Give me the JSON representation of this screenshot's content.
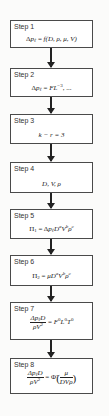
{
  "diagram": {
    "title": "",
    "steps": [
      {
        "label": "Step 1",
        "formula": "Δp_ℓ = f(D, ρ, μ, V)"
      },
      {
        "label": "Step 2",
        "formula": "Δp_ℓ = FL^−3, ..."
      },
      {
        "label": "Step 3",
        "formula": "k − r = 3"
      },
      {
        "label": "Step 4",
        "formula": "D, V, ρ"
      },
      {
        "label": "Step 5",
        "formula": "Π_1 = Δp_ℓ D^a V^b ρ^c"
      },
      {
        "label": "Step 6",
        "formula": "Π_2 = μ D^a V^b ρ^c"
      },
      {
        "label": "Step 7",
        "formula": "Δp_ℓ D / (ρV^2) = F^0 L^0 T^0"
      },
      {
        "label": "Step 8",
        "formula": "Δp_ℓ D / (ρV^2) = Φ̃(μ / (DVρ))"
      }
    ],
    "edges": [
      {
        "from": "Step 1",
        "to": "Step 2"
      },
      {
        "from": "Step 2",
        "to": "Step 3"
      },
      {
        "from": "Step 3",
        "to": "Step 4"
      },
      {
        "from": "Step 4",
        "to": "Step 5"
      },
      {
        "from": "Step 5",
        "to": "Step 6"
      },
      {
        "from": "Step 6",
        "to": "Step 7"
      },
      {
        "from": "Step 7",
        "to": "Step 8"
      }
    ],
    "parts": {
      "s1": {
        "lhs": "Δ",
        "p": "p",
        "sub": "ℓ",
        "eq": " = ",
        "f": "f",
        "args": "(D, ρ, μ, V)"
      },
      "s2": {
        "lhs": "Δ",
        "p": "p",
        "sub": "ℓ",
        "eq": " = ",
        "F": "FL",
        "exp": "−3",
        "tail": ", ..."
      },
      "s3": {
        "text": "k − r = 3"
      },
      "s4": {
        "text": "D, V, ρ"
      },
      "s5": {
        "pi": "Π",
        "pisub": "1",
        "eq": " = Δ",
        "p": "p",
        "sub": "ℓ",
        "D": "D",
        "a": "a",
        "V": "V",
        "b": "b",
        "rho": "ρ",
        "c": "c"
      },
      "s6": {
        "pi": "Π",
        "pisub": "2",
        "eq": " = ",
        "mu": "μ",
        "D": "D",
        "a": "a",
        "V": "V",
        "b": "b",
        "rho": "ρ",
        "c": "c"
      },
      "s7": {
        "num": "Δp",
        "numsub": "ℓ",
        "numD": "D",
        "den": "ρV",
        "denexp": "2",
        "eq": " = ",
        "F": "F",
        "z1": "0",
        "L": "L",
        "z2": "0",
        "T": "T",
        "z3": "0"
      },
      "s8": {
        "num": "Δp",
        "numsub": "ℓ",
        "numD": "D",
        "den": "ρV",
        "denexp": "2",
        "eq": " = ",
        "phi": "Φ̃",
        "lp": "(",
        "inum": "μ",
        "iden": "DVρ",
        "rp": ")"
      }
    }
  },
  "colors": {
    "border": "#4a4a4a",
    "arrow": "#222222",
    "background": "#fbfbfa",
    "box": "#ffffff"
  }
}
